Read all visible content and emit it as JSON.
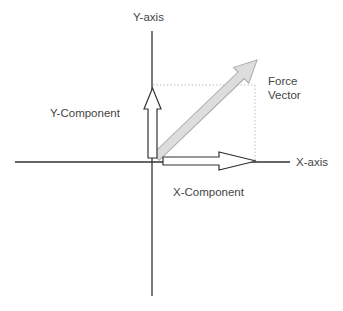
{
  "diagram": {
    "axes": {
      "y_label": "Y-axis",
      "x_label": "X-axis"
    },
    "vectors": {
      "force_label_line1": "Force",
      "force_label_line2": "Vector",
      "y_component_label": "Y-Component",
      "x_component_label": "X-Component"
    },
    "colors": {
      "axis": "#333333",
      "component_outline": "#333333",
      "component_fill": "#ffffff",
      "force_fill": "#dddddd",
      "force_outline": "#aaaaaa",
      "guide_dotted": "#bbbbbb",
      "text": "#444444"
    }
  }
}
